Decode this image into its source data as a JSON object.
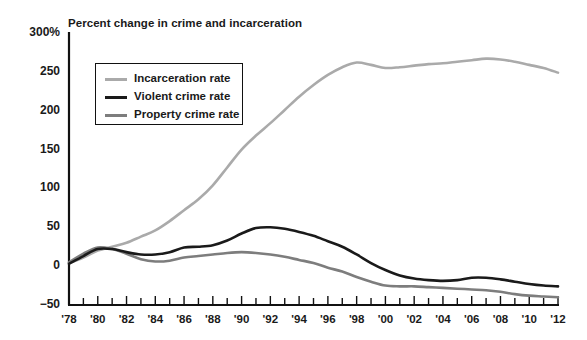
{
  "chart_data": {
    "type": "line",
    "title": "Percent change in crime and incarceration",
    "xlabel": "",
    "ylabel": "",
    "ylim": [
      -50,
      300
    ],
    "xlim": [
      1978,
      2012
    ],
    "grid": false,
    "legend_position": "top-left",
    "yticks": [
      {
        "value": 300,
        "label": "300%"
      },
      {
        "value": 250,
        "label": "250"
      },
      {
        "value": 200,
        "label": "200"
      },
      {
        "value": 150,
        "label": "150"
      },
      {
        "value": 100,
        "label": "100"
      },
      {
        "value": 50,
        "label": "50"
      },
      {
        "value": 0,
        "label": "0"
      },
      {
        "value": -50,
        "label": "−50"
      }
    ],
    "xticks": [
      {
        "value": 1978,
        "label": "'78"
      },
      {
        "value": 1979,
        "label": ""
      },
      {
        "value": 1980,
        "label": "'80"
      },
      {
        "value": 1981,
        "label": ""
      },
      {
        "value": 1982,
        "label": "'82"
      },
      {
        "value": 1983,
        "label": ""
      },
      {
        "value": 1984,
        "label": "'84"
      },
      {
        "value": 1985,
        "label": ""
      },
      {
        "value": 1986,
        "label": "'86"
      },
      {
        "value": 1987,
        "label": ""
      },
      {
        "value": 1988,
        "label": "'88"
      },
      {
        "value": 1989,
        "label": ""
      },
      {
        "value": 1990,
        "label": "'90"
      },
      {
        "value": 1991,
        "label": ""
      },
      {
        "value": 1992,
        "label": "'92"
      },
      {
        "value": 1993,
        "label": ""
      },
      {
        "value": 1994,
        "label": "'94"
      },
      {
        "value": 1995,
        "label": ""
      },
      {
        "value": 1996,
        "label": "'96"
      },
      {
        "value": 1997,
        "label": ""
      },
      {
        "value": 1998,
        "label": "'98"
      },
      {
        "value": 1999,
        "label": ""
      },
      {
        "value": 2000,
        "label": "'00"
      },
      {
        "value": 2001,
        "label": ""
      },
      {
        "value": 2002,
        "label": "'02"
      },
      {
        "value": 2003,
        "label": ""
      },
      {
        "value": 2004,
        "label": "'04"
      },
      {
        "value": 2005,
        "label": ""
      },
      {
        "value": 2006,
        "label": "'06"
      },
      {
        "value": 2007,
        "label": ""
      },
      {
        "value": 2008,
        "label": "'08"
      },
      {
        "value": 2009,
        "label": ""
      },
      {
        "value": 2010,
        "label": "'10"
      },
      {
        "value": 2011,
        "label": ""
      },
      {
        "value": 2012,
        "label": "'12"
      }
    ],
    "x": [
      1978,
      1979,
      1980,
      1981,
      1982,
      1983,
      1984,
      1985,
      1986,
      1987,
      1988,
      1989,
      1990,
      1991,
      1992,
      1993,
      1994,
      1995,
      1996,
      1997,
      1998,
      1999,
      2000,
      2001,
      2002,
      2003,
      2004,
      2005,
      2006,
      2007,
      2008,
      2009,
      2010,
      2011,
      2012
    ],
    "series": [
      {
        "name": "Incarceration rate",
        "color": "#aaaaaa",
        "width": 2.6,
        "values": [
          4,
          11,
          20,
          25,
          30,
          38,
          46,
          58,
          72,
          86,
          104,
          127,
          150,
          168,
          184,
          201,
          218,
          233,
          246,
          256,
          262,
          259,
          255,
          256,
          258,
          260,
          261,
          263,
          265,
          267,
          266,
          263,
          259,
          255,
          249
        ]
      },
      {
        "name": "Violent crime rate",
        "color": "#1a1a1a",
        "width": 2.6,
        "values": [
          3,
          13,
          22,
          22,
          18,
          15,
          15,
          18,
          24,
          25,
          27,
          33,
          42,
          49,
          50,
          48,
          44,
          39,
          32,
          25,
          15,
          4,
          -5,
          -12,
          -16,
          -18,
          -19,
          -18,
          -15,
          -15,
          -17,
          -20,
          -23,
          -25,
          -26
        ]
      },
      {
        "name": "Property crime rate",
        "color": "#7d7d7d",
        "width": 2.6,
        "values": [
          5,
          16,
          24,
          22,
          16,
          9,
          6,
          7,
          11,
          13,
          15,
          17,
          18,
          17,
          15,
          12,
          8,
          4,
          -2,
          -7,
          -14,
          -20,
          -25,
          -26,
          -26,
          -27,
          -28,
          -29,
          -30,
          -31,
          -33,
          -36,
          -38,
          -39,
          -40
        ]
      }
    ]
  }
}
